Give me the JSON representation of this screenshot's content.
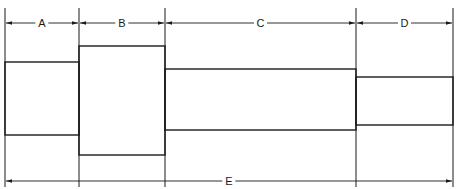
{
  "diagram": {
    "type": "stepped-shaft-dimension-drawing",
    "caption_fragment": "",
    "colors": {
      "line": "#1a1a1a",
      "background": "#ffffff"
    },
    "dimensions": [
      {
        "id": "A",
        "label": "A",
        "x_start": 5,
        "x_end": 79,
        "line_y": 23
      },
      {
        "id": "B",
        "label": "B",
        "x_start": 79,
        "x_end": 165,
        "line_y": 23
      },
      {
        "id": "C",
        "label": "C",
        "x_start": 165,
        "x_end": 356,
        "line_y": 23
      },
      {
        "id": "D",
        "label": "D",
        "x_start": 356,
        "x_end": 453,
        "line_y": 23
      },
      {
        "id": "E",
        "label": "E",
        "x_start": 5,
        "x_end": 453,
        "line_y": 181
      }
    ],
    "sections": [
      {
        "id": "section-a",
        "x": 5,
        "y": 62,
        "w": 74,
        "h": 73
      },
      {
        "id": "section-b",
        "x": 79,
        "y": 46,
        "w": 86,
        "h": 109
      },
      {
        "id": "section-c",
        "x": 165,
        "y": 69,
        "w": 191,
        "h": 61
      },
      {
        "id": "section-d",
        "x": 356,
        "y": 77,
        "w": 97,
        "h": 48
      }
    ]
  }
}
